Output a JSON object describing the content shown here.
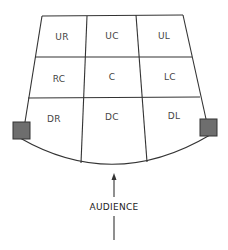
{
  "areas": {
    "upstage": [
      "UR",
      "UC",
      "UL"
    ],
    "center": [
      "RC",
      "C",
      "LC"
    ],
    "downstage": [
      "DR",
      "DC",
      "DL"
    ]
  },
  "audience_label": "AUDIENCE",
  "colors": {
    "line": "#333333",
    "box_fill": "#6e6e6e",
    "text": "#444444"
  }
}
